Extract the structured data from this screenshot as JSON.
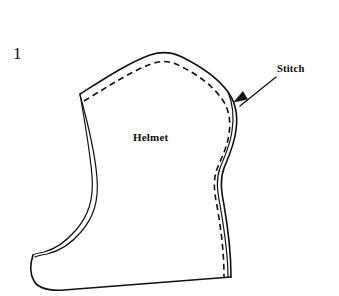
{
  "figure": {
    "number": "1",
    "background_color": "#ffffff",
    "ink_color": "#111111",
    "width": 339,
    "height": 296
  },
  "labels": {
    "figure_number": "1",
    "helmet": "Helmet",
    "stitch": "Stitch"
  },
  "annotations": {
    "stitch_callout": {
      "text": "Stitch",
      "leader_from": [
        276,
        77
      ],
      "leader_to": [
        234,
        102
      ],
      "arrowhead": "filled-triangle"
    }
  },
  "drawing": {
    "description": "Line-art sewing pattern piece for a helmet / hood, side view, with a dashed stitching line running inside the outer seam edge",
    "outer_outline_path": "M 80 94 C 104 79 128 63 150 55 C 162 51 172 52 182 57 C 200 66 218 78 228 92 C 236 103 238 116 236 130 C 234 146 228 158 224 168 C 220 179 221 190 224 205 C 228 228 231 252 231 277",
    "bottom_edge_path": "M 231 277 L 64 290 C 48 291 38 288 34 281 C 30 274 30 264 33 255",
    "left_inner_path": "M 80 94 C 84 118 90 150 92 176 C 94 200 88 216 76 230 C 64 244 52 250 44 252 C 38 253 35 254 33 255",
    "left_outer_path": "M 80 95 C 87 120 95 152 97 178 C 99 202 93 218 81 232 C 69 246 56 252 47 254 C 41 255 37 256 35 257",
    "right_inner_edge_path": "M 228 92 C 233 104 234 118 232 131 C 230 146 224 158 220 168 C 216 179 217 190 220 205 C 224 228 228 252 228 277",
    "stitch_dashed_path": "M 84 101 C 107 87 130 72 151 64 C 162 60 171 61 180 66 C 197 74 213 86 222 99 C 229 109 231 121 229 134 C 227 148 221 159 217 169 C 213 180 214 191 217 206 C 221 229 224 252 224 277",
    "stitch_dash_pattern": [
      6,
      4
    ],
    "line_width_outer": 1.6,
    "line_width_inner": 1.2,
    "line_width_stitch": 1.6
  }
}
